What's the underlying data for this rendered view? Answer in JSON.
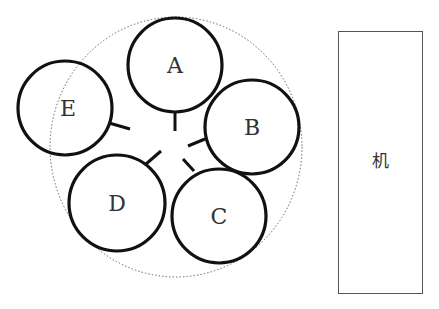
{
  "diagram": {
    "circles": [
      {
        "id": "A",
        "label": "A",
        "cx": 175,
        "cy": 65,
        "r": 47
      },
      {
        "id": "B",
        "label": "B",
        "cx": 252,
        "cy": 127,
        "r": 47
      },
      {
        "id": "C",
        "label": "C",
        "cx": 219,
        "cy": 216,
        "r": 47
      },
      {
        "id": "D",
        "label": "D",
        "cx": 117,
        "cy": 203,
        "r": 48
      },
      {
        "id": "E",
        "label": "E",
        "cx": 65,
        "cy": 108,
        "r": 47
      }
    ],
    "boundary": {
      "cx": 176,
      "cy": 147,
      "rx": 126,
      "ry": 130,
      "style": "dotted"
    },
    "machine_box": {
      "label": "机",
      "x": 338,
      "y": 31,
      "width": 84,
      "height": 262
    },
    "colors": {
      "stroke": "#111111",
      "text": "#333333",
      "box_stroke": "#555555",
      "dotted": "#666666"
    }
  }
}
